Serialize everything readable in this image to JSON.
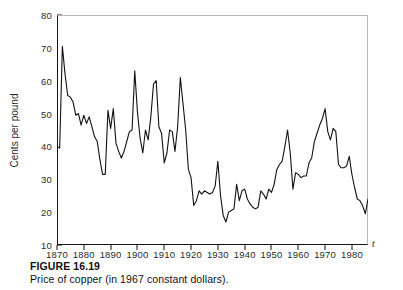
{
  "figure": {
    "caption_label": "FIGURE 16.19",
    "caption_text": "Price of copper (in 1967 constant dollars)."
  },
  "chart_data": {
    "type": "line",
    "title": "",
    "xlabel": "t",
    "ylabel": "Cents per pound",
    "xlim": [
      1870,
      1986
    ],
    "ylim": [
      10,
      80
    ],
    "xticks": [
      1870,
      1880,
      1890,
      1900,
      1910,
      1920,
      1930,
      1940,
      1950,
      1960,
      1970,
      1980
    ],
    "yticks": [
      10,
      20,
      30,
      40,
      50,
      60,
      70,
      80
    ],
    "grid": false,
    "legend": null,
    "line_color": "#111111",
    "series": [
      {
        "name": "Price of copper (1967 constant dollars)",
        "x": [
          1870,
          1871,
          1872,
          1873,
          1874,
          1875,
          1876,
          1877,
          1878,
          1879,
          1880,
          1881,
          1882,
          1883,
          1884,
          1885,
          1886,
          1887,
          1888,
          1889,
          1890,
          1891,
          1892,
          1893,
          1894,
          1895,
          1896,
          1897,
          1898,
          1899,
          1900,
          1901,
          1902,
          1903,
          1904,
          1905,
          1906,
          1907,
          1908,
          1909,
          1910,
          1911,
          1912,
          1913,
          1914,
          1915,
          1916,
          1917,
          1918,
          1919,
          1920,
          1921,
          1922,
          1923,
          1924,
          1925,
          1926,
          1927,
          1928,
          1929,
          1930,
          1931,
          1932,
          1933,
          1934,
          1935,
          1936,
          1937,
          1938,
          1939,
          1940,
          1941,
          1942,
          1943,
          1944,
          1945,
          1946,
          1947,
          1948,
          1949,
          1950,
          1951,
          1952,
          1953,
          1954,
          1955,
          1956,
          1957,
          1958,
          1959,
          1960,
          1961,
          1962,
          1963,
          1964,
          1965,
          1966,
          1967,
          1968,
          1969,
          1970,
          1971,
          1972,
          1973,
          1974,
          1975,
          1976,
          1977,
          1978,
          1979,
          1980,
          1981,
          1982,
          1983,
          1984,
          1985,
          1986
        ],
        "values": [
          40.0,
          39.5,
          70.5,
          62.0,
          55.5,
          55.0,
          53.5,
          49.5,
          50.0,
          46.5,
          49.5,
          47.0,
          49.0,
          46.0,
          43.0,
          41.5,
          36.0,
          31.5,
          31.5,
          51.0,
          45.5,
          51.5,
          41.0,
          38.5,
          36.5,
          38.5,
          41.5,
          44.5,
          45.0,
          63.0,
          50.5,
          42.5,
          38.0,
          45.0,
          42.0,
          49.0,
          59.0,
          60.0,
          46.0,
          44.0,
          35.0,
          38.0,
          45.0,
          44.5,
          38.5,
          46.0,
          61.0,
          53.0,
          45.0,
          33.0,
          30.5,
          22.0,
          23.5,
          26.5,
          25.5,
          26.5,
          26.0,
          25.5,
          26.0,
          28.0,
          35.5,
          25.0,
          19.0,
          17.0,
          20.0,
          20.5,
          21.0,
          28.5,
          23.5,
          26.5,
          27.0,
          24.0,
          22.5,
          21.5,
          21.0,
          21.5,
          26.5,
          25.5,
          24.0,
          27.0,
          26.0,
          28.5,
          33.0,
          34.5,
          35.5,
          40.0,
          45.0,
          38.0,
          27.0,
          32.0,
          31.5,
          30.5,
          31.0,
          31.0,
          35.0,
          36.5,
          41.5,
          44.0,
          46.5,
          48.5,
          51.5,
          44.5,
          42.0,
          45.5,
          44.5,
          34.5,
          33.5,
          33.5,
          34.0,
          37.0,
          31.5,
          27.5,
          24.0,
          23.5,
          22.0,
          19.5,
          24.0
        ]
      }
    ]
  }
}
